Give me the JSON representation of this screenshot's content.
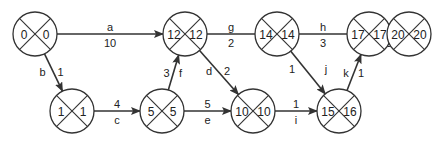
{
  "diagram": {
    "type": "activity-on-arrow network",
    "node_radius": 22,
    "colors": {
      "stroke": "#333333",
      "text": "#222222",
      "background": "#ffffff"
    },
    "nodes": [
      {
        "id": "n0",
        "x": 35,
        "y": 34,
        "early": "0",
        "late": "0"
      },
      {
        "id": "n12",
        "x": 185,
        "y": 34,
        "early": "12",
        "late": "12"
      },
      {
        "id": "n14",
        "x": 277,
        "y": 34,
        "early": "14",
        "late": "14"
      },
      {
        "id": "n17",
        "x": 369,
        "y": 34,
        "early": "17",
        "late": "17"
      },
      {
        "id": "n20",
        "x": 409,
        "y": 34,
        "early": "20",
        "late": "20"
      },
      {
        "id": "n1",
        "x": 72,
        "y": 111,
        "early": "1",
        "late": "1"
      },
      {
        "id": "n5",
        "x": 162,
        "y": 111,
        "early": "5",
        "late": "5"
      },
      {
        "id": "n10",
        "x": 253,
        "y": 111,
        "early": "10",
        "late": "10"
      },
      {
        "id": "n15",
        "x": 339,
        "y": 111,
        "early": "15",
        "late": "16"
      }
    ],
    "edges": [
      {
        "activity": "a",
        "duration": "10",
        "from": "n0",
        "to": "n12",
        "arrow": true
      },
      {
        "activity": "b",
        "duration": "1",
        "from": "n0",
        "to": "n1",
        "arrow": true
      },
      {
        "activity": "c",
        "duration": "4",
        "from": "n1",
        "to": "n5",
        "arrow": true
      },
      {
        "activity": "f",
        "duration": "3",
        "from": "n5",
        "to": "n12",
        "arrow": true
      },
      {
        "activity": "e",
        "duration": "5",
        "from": "n5",
        "to": "n10",
        "arrow": true
      },
      {
        "activity": "d",
        "duration": "2",
        "from": "n12",
        "to": "n10",
        "arrow": true
      },
      {
        "activity": "g",
        "duration": "2",
        "from": "n12",
        "to": "n14",
        "arrow": false
      },
      {
        "activity": "h",
        "duration": "3",
        "from": "n14",
        "to": "n17",
        "arrow": false
      },
      {
        "activity": "j",
        "duration": "1",
        "from": "n14",
        "to": "n15",
        "arrow": true
      },
      {
        "activity": "i",
        "duration": "1",
        "from": "n10",
        "to": "n15",
        "arrow": true
      },
      {
        "activity": "k",
        "duration": "1",
        "from": "n15",
        "to": "n17",
        "arrow": true
      },
      {
        "activity": "l",
        "duration": "3",
        "from": "n17",
        "to": "n20",
        "arrow": false
      }
    ]
  }
}
